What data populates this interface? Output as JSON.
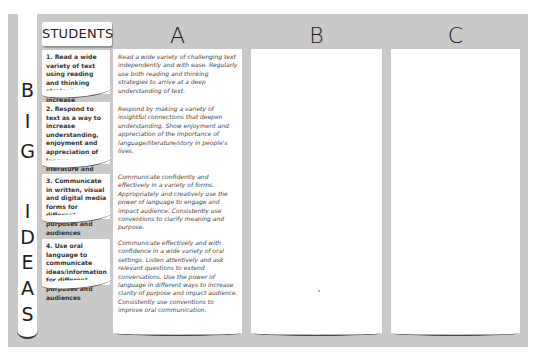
{
  "sidebar": {
    "title_letters": [
      "B",
      "I",
      "G",
      "I",
      "D",
      "E",
      "A",
      "S"
    ],
    "title": "BIG IDEAS"
  },
  "students": {
    "header": "STUDENTS",
    "items": [
      {
        "label": "1. Read a wide variety of text using reading and thinking strategies to increase understanding"
      },
      {
        "label": "2. Respond to text as a way to increase understanding, enjoyment and appreciation of language, literature and story"
      },
      {
        "label": "3. Communicate in written, visual and digital media forms for different purposes and audiences"
      },
      {
        "label": "4. Use oral language to communicate ideas/information for different purposes and audiences"
      }
    ]
  },
  "columns": [
    {
      "header": "A",
      "descriptions": [
        "Read a wide variety of challenging text independently and with ease. Regularly use both reading and thinking strategies to arrive at a deep understanding of text.",
        "Respond by making a variety of insightful connections that deepen understanding. Show enjoyment and appreciation of the importance of language/literature/story in people's lives.",
        "Communicate confidently and effectively in a variety of forms. Appropriately and creatively use the power of language to engage and impact audience. Consistently use conventions to clarify meaning and purpose.",
        "Communicate effectively and with confidence in a wide variety of oral settings. Listen attentively and ask relevant questions to extend conversations. Use the power of language in different ways to increase clarity of purpose and impact audience. Consistently use conventions to improve oral communication."
      ]
    },
    {
      "header": "B",
      "descriptions": []
    },
    {
      "header": "C",
      "descriptions": []
    }
  ],
  "colors": {
    "frame": "#c9c9c9",
    "paper": "#ffffff",
    "text": "#333333"
  }
}
